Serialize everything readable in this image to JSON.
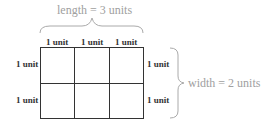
{
  "length_label": "length = 3 units",
  "width_label": "width = 2 units",
  "col_labels": [
    "1 unit",
    "1 unit",
    "1 unit"
  ],
  "row_labels_left": [
    "1 unit",
    "1 unit"
  ],
  "row_labels_right": [
    "1 unit",
    "1 unit"
  ],
  "grid": {
    "columns": 3,
    "rows": 2
  }
}
